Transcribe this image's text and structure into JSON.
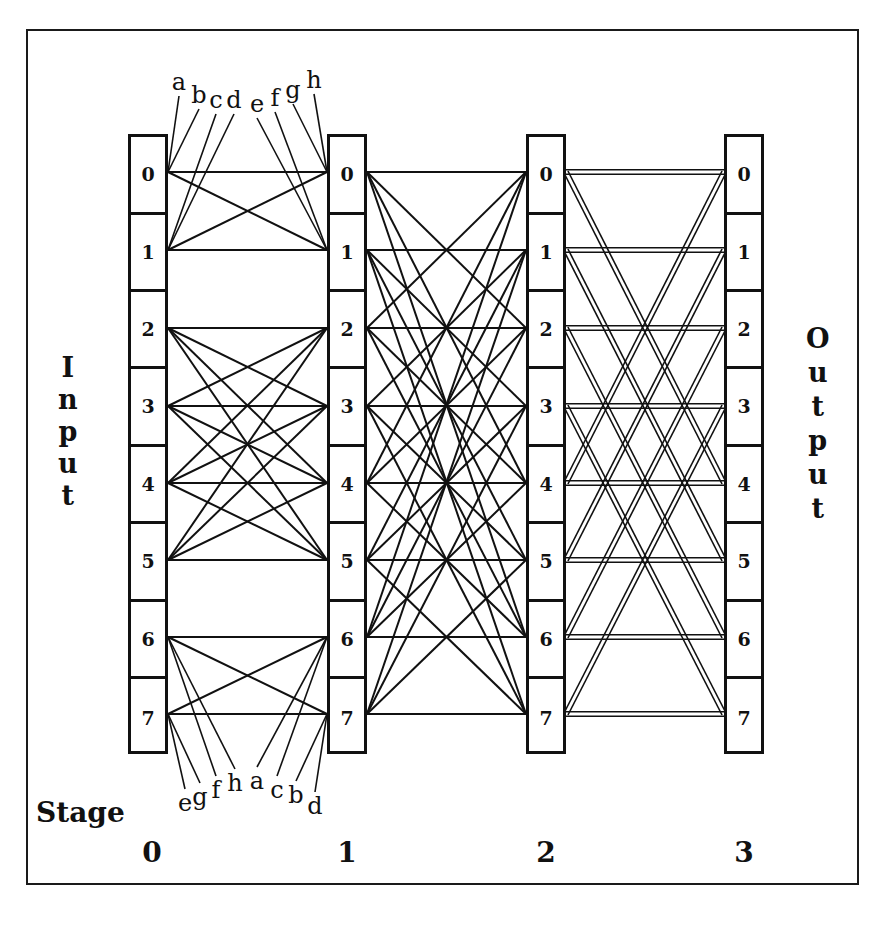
{
  "diagram": {
    "input_label": [
      "I",
      "n",
      "p",
      "u",
      "t"
    ],
    "output_label": [
      "O",
      "u",
      "t",
      "p",
      "u",
      "t"
    ],
    "stage_word": "Stage",
    "stages": [
      {
        "label": "0",
        "x": 128,
        "nodes": [
          "0",
          "1",
          "2",
          "3",
          "4",
          "5",
          "6",
          "7"
        ]
      },
      {
        "label": "1",
        "x": 327,
        "nodes": [
          "0",
          "1",
          "2",
          "3",
          "4",
          "5",
          "6",
          "7"
        ]
      },
      {
        "label": "2",
        "x": 526,
        "nodes": [
          "0",
          "1",
          "2",
          "3",
          "4",
          "5",
          "6",
          "7"
        ]
      },
      {
        "label": "3",
        "x": 724,
        "nodes": [
          "0",
          "1",
          "2",
          "3",
          "4",
          "5",
          "6",
          "7"
        ]
      }
    ],
    "row_centers": [
      172,
      250,
      328,
      406,
      483,
      560,
      637,
      714
    ],
    "links": {
      "stage0_to_1": "full connection within groups {0,1}, {2,3,4,5}, {6,7}",
      "stage1_to_2": "node i connects to every node of same parity (i, i±2, i±4, i±6)",
      "stage2_to_3": "node i connects to i and i XOR 4 (double lines)"
    },
    "top_wire_labels": [
      {
        "text": "a",
        "x": 179,
        "y": 82,
        "to": "s0n0"
      },
      {
        "text": "b",
        "x": 199,
        "y": 95,
        "to": "s0n0"
      },
      {
        "text": "c",
        "x": 216,
        "y": 100,
        "to": "s0n1"
      },
      {
        "text": "d",
        "x": 234,
        "y": 100,
        "to": "s0n1"
      },
      {
        "text": "e",
        "x": 257,
        "y": 104,
        "to": "s1n1"
      },
      {
        "text": "f",
        "x": 275,
        "y": 98,
        "to": "s1n1"
      },
      {
        "text": "g",
        "x": 293,
        "y": 90,
        "to": "s1n0"
      },
      {
        "text": "h",
        "x": 314,
        "y": 80,
        "to": "s1n0"
      }
    ],
    "bottom_wire_labels": [
      {
        "text": "e",
        "x": 185,
        "y": 803,
        "to": "s0n7"
      },
      {
        "text": "g",
        "x": 200,
        "y": 797,
        "to": "s0n7"
      },
      {
        "text": "f",
        "x": 216,
        "y": 790,
        "to": "s0n6"
      },
      {
        "text": "h",
        "x": 235,
        "y": 783,
        "to": "s0n6"
      },
      {
        "text": "a",
        "x": 257,
        "y": 781,
        "to": "s1n6"
      },
      {
        "text": "c",
        "x": 277,
        "y": 790,
        "to": "s1n6"
      },
      {
        "text": "b",
        "x": 296,
        "y": 795,
        "to": "s1n7"
      },
      {
        "text": "d",
        "x": 315,
        "y": 806,
        "to": "s1n7"
      }
    ]
  }
}
